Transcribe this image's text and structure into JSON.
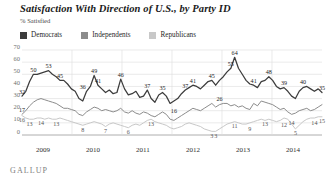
{
  "header": {
    "title": "Satisfaction With Direction of U.S., by Party ID",
    "subtitle": "% Satisfied",
    "source": "GALLUP"
  },
  "legend": {
    "position": "top-left",
    "items": [
      {
        "label": "Democrats",
        "color": "#3c3c3c"
      },
      {
        "label": "Independents",
        "color": "#8c8c8c"
      },
      {
        "label": "Republicans",
        "color": "#c8c8c8"
      }
    ]
  },
  "chart_data": {
    "type": "line",
    "title": "Satisfaction With Direction of U.S., by Party ID",
    "subtitle": "% Satisfied",
    "xlabel": "",
    "ylabel": "% Satisfied",
    "ylim": [
      0,
      70
    ],
    "yticks": [
      0,
      10,
      20,
      30,
      40,
      50,
      60,
      70
    ],
    "grid": true,
    "xticks": [
      "2009",
      "2010",
      "2011",
      "2012",
      "2013",
      "2014"
    ],
    "series": [
      {
        "name": "Democrats",
        "color": "#3c3c3c",
        "values": [
          32,
          36,
          44,
          50,
          50,
          51,
          52,
          53,
          50,
          48,
          45,
          45,
          42,
          38,
          36,
          30,
          28,
          36,
          40,
          49,
          41,
          38,
          35,
          37,
          34,
          35,
          46,
          38,
          33,
          34,
          36,
          31,
          32,
          37,
          30,
          27,
          33,
          35,
          32,
          26,
          28,
          30,
          34,
          37,
          39,
          41,
          40,
          38,
          41,
          44,
          45,
          41,
          45,
          48,
          52,
          55,
          64,
          55,
          50,
          45,
          42,
          41,
          39,
          44,
          45,
          48,
          45,
          40,
          38,
          39,
          36,
          32,
          30,
          36,
          39,
          40,
          38,
          36,
          38,
          35
        ],
        "labels": [
          {
            "index": 0,
            "value": 32
          },
          {
            "index": 3,
            "value": 50
          },
          {
            "index": 7,
            "value": 53
          },
          {
            "index": 10,
            "value": 45
          },
          {
            "index": 16,
            "value": 36
          },
          {
            "index": 19,
            "value": 49
          },
          {
            "index": 20,
            "value": 41
          },
          {
            "index": 26,
            "value": 46
          },
          {
            "index": 33,
            "value": 37
          },
          {
            "index": 37,
            "value": 35
          },
          {
            "index": 43,
            "value": 37
          },
          {
            "index": 45,
            "value": 41
          },
          {
            "index": 50,
            "value": 45
          },
          {
            "index": 55,
            "value": 55
          },
          {
            "index": 56,
            "value": 64
          },
          {
            "index": 61,
            "value": 41
          },
          {
            "index": 65,
            "value": 48
          },
          {
            "index": 69,
            "value": 39
          },
          {
            "index": 74,
            "value": 40
          },
          {
            "index": 79,
            "value": 35
          }
        ]
      },
      {
        "name": "Independents",
        "color": "#8c8c8c",
        "values": [
          17,
          20,
          24,
          27,
          29,
          30,
          29,
          28,
          27,
          26,
          24,
          22,
          22,
          21,
          20,
          17,
          16,
          19,
          21,
          23,
          22,
          20,
          21,
          20,
          19,
          20,
          22,
          19,
          18,
          20,
          18,
          17,
          19,
          18,
          16,
          15,
          17,
          19,
          17,
          13,
          12,
          14,
          16,
          18,
          20,
          22,
          21,
          20,
          22,
          24,
          26,
          23,
          25,
          26,
          26,
          24,
          25,
          23,
          24,
          22,
          21,
          26,
          24,
          28,
          27,
          26,
          25,
          23,
          21,
          22,
          19,
          17,
          18,
          20,
          21,
          22,
          20,
          21,
          23,
          25
        ],
        "labels": [
          {
            "index": 0,
            "value": 17
          },
          {
            "index": 40,
            "value": 16
          },
          {
            "index": 52,
            "value": 26
          }
        ]
      },
      {
        "name": "Republicans",
        "color": "#c8c8c8",
        "values": [
          16,
          14,
          13,
          13,
          14,
          14,
          13,
          14,
          13,
          13,
          14,
          13,
          12,
          11,
          10,
          9,
          8,
          9,
          10,
          11,
          10,
          9,
          7,
          9,
          10,
          9,
          8,
          7,
          6,
          8,
          9,
          8,
          10,
          12,
          13,
          11,
          10,
          9,
          8,
          6,
          5,
          6,
          7,
          9,
          10,
          9,
          8,
          7,
          5,
          4,
          3,
          3,
          5,
          7,
          9,
          10,
          11,
          10,
          9,
          9,
          10,
          11,
          12,
          13,
          12,
          13,
          12,
          11,
          12,
          14,
          13,
          9,
          5,
          8,
          11,
          13,
          14,
          14,
          15,
          15
        ],
        "labels": [
          {
            "index": 0,
            "value": 16
          },
          {
            "index": 2,
            "value": 13
          },
          {
            "index": 5,
            "value": 14
          },
          {
            "index": 9,
            "value": 13
          },
          {
            "index": 16,
            "value": 8
          },
          {
            "index": 22,
            "value": 7
          },
          {
            "index": 28,
            "value": 6
          },
          {
            "index": 34,
            "value": 13
          },
          {
            "index": 50,
            "value": 3
          },
          {
            "index": 51,
            "value": 3
          },
          {
            "index": 56,
            "value": 11
          },
          {
            "index": 60,
            "value": 9
          },
          {
            "index": 64,
            "value": 13
          },
          {
            "index": 69,
            "value": 12
          },
          {
            "index": 71,
            "value": 14
          },
          {
            "index": 72,
            "value": 5
          },
          {
            "index": 77,
            "value": 14
          },
          {
            "index": 79,
            "value": 15
          }
        ]
      }
    ]
  }
}
